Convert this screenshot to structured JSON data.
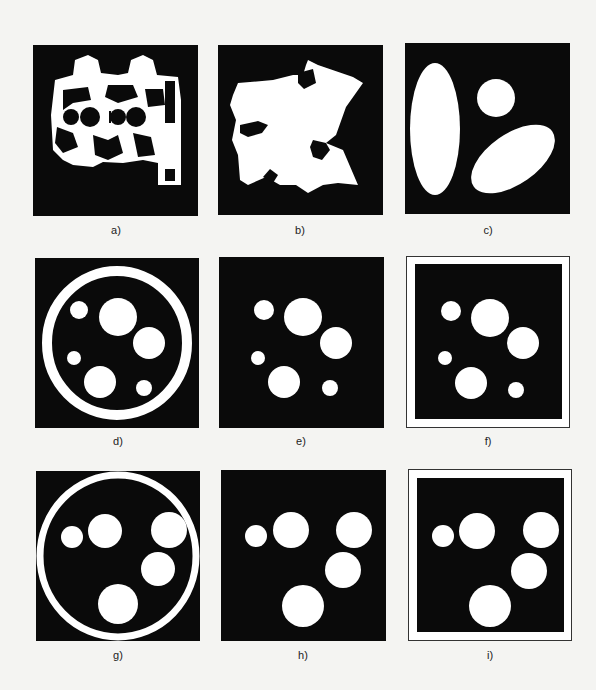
{
  "figure": {
    "colors": {
      "background": "#f4f4f2",
      "panel": "#0a0a0a",
      "shape": "#ffffff",
      "frame": "#333333"
    },
    "panels": [
      {
        "id": "a",
        "label": "a)",
        "description": "binary image of mechanical part with circular holes"
      },
      {
        "id": "b",
        "label": "b)",
        "description": "binary image of irregular map-like region"
      },
      {
        "id": "c",
        "label": "c)",
        "description": "two ellipses and a circle"
      },
      {
        "id": "d",
        "label": "d)",
        "description": "six circles inside a ring"
      },
      {
        "id": "e",
        "label": "e)",
        "description": "six circles, ring removed"
      },
      {
        "id": "f",
        "label": "f)",
        "description": "six circles with white frame border"
      },
      {
        "id": "g",
        "label": "g)",
        "description": "five circles inside a ring"
      },
      {
        "id": "h",
        "label": "h)",
        "description": "five circles, ring removed"
      },
      {
        "id": "i",
        "label": "i)",
        "description": "five circles with white frame border"
      }
    ]
  }
}
